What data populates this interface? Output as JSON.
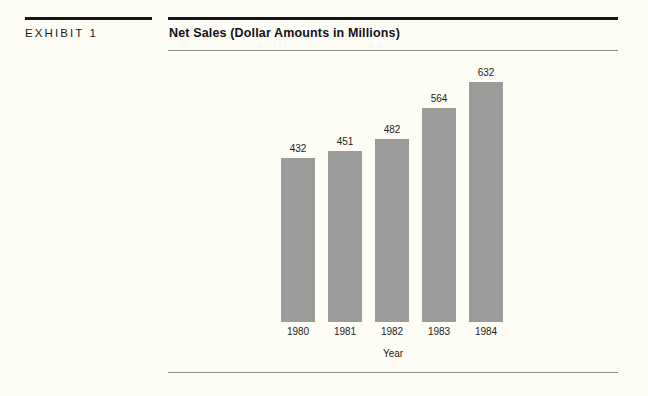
{
  "exhibit": {
    "label": "EXHIBIT 1"
  },
  "chart_title": "Net Sales (Dollar Amounts in Millions)",
  "colors": {
    "page_background": "#fdfcf5",
    "bar_fill": "#9b9b99",
    "rule_thick": "#15151a",
    "rule_thin": "#8d8d8a",
    "text": "#1d1d22"
  },
  "chart_data": {
    "type": "bar",
    "title": "Net Sales (Dollar Amounts in Millions)",
    "xlabel": "Year",
    "ylabel": "",
    "categories": [
      "1980",
      "1981",
      "1982",
      "1983",
      "1984"
    ],
    "values": [
      432,
      451,
      482,
      564,
      632
    ],
    "value_labels": [
      "432",
      "451",
      "482",
      "564",
      "632"
    ],
    "ylim": [
      0,
      700
    ],
    "grid": false,
    "legend": false,
    "axis_visible": false,
    "data_labels_position": "above-bar"
  }
}
